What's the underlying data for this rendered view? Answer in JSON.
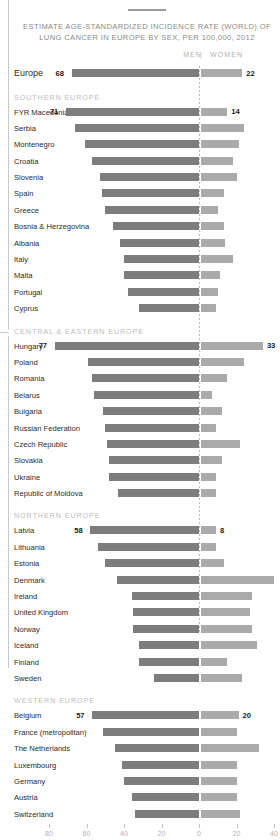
{
  "title": "ESTIMATE AGE-STANDARDIZED INCIDENCE RATE (WORLD) OF LUNG CANCER IN EUROPE BY SEX, PER 100,000, 2012",
  "legend": {
    "men": "MEN",
    "separator": "|",
    "women": "WOMEN"
  },
  "chart_data": {
    "type": "bar",
    "variant": "diverging-horizontal",
    "title": "ESTIMATE AGE-STANDARDIZED INCIDENCE RATE (WORLD) OF LUNG CANCER IN EUROPE BY SEX, PER 100,000, 2012",
    "xlabel": "",
    "ylabel": "",
    "grid": false,
    "legend_position": "top-right",
    "axis": {
      "ticks": [
        80,
        60,
        40,
        20,
        0,
        20,
        40
      ],
      "tick_labels": [
        "80",
        "60",
        "40",
        "20",
        "0",
        "20",
        "40"
      ],
      "left_max": 80,
      "right_max": 40
    },
    "series": [
      {
        "name": "MEN",
        "color": "#7d7d7d",
        "direction": "left"
      },
      {
        "name": "WOMEN",
        "color": "#aaaaaa",
        "direction": "right"
      }
    ],
    "summary_row": {
      "label": "Europe",
      "men": 68,
      "women": 22
    },
    "sections": [
      {
        "label": "SOUTHERN EUROPE",
        "rows": [
          {
            "label": "FYR Macedonia",
            "men": 71,
            "women": 14,
            "show_values": true
          },
          {
            "label": "Serbia",
            "men": 66,
            "women": 23,
            "show_values": false
          },
          {
            "label": "Montenegro",
            "men": 61,
            "women": 20,
            "show_values": false
          },
          {
            "label": "Croatia",
            "men": 57,
            "women": 17,
            "show_values": false
          },
          {
            "label": "Slovenia",
            "men": 53,
            "women": 19,
            "show_values": false
          },
          {
            "label": "Spain",
            "men": 52,
            "women": 12,
            "show_values": false
          },
          {
            "label": "Greece",
            "men": 50,
            "women": 9,
            "show_values": false
          },
          {
            "label": "Bosnia & Herzegovina",
            "men": 46,
            "women": 12,
            "show_values": false
          },
          {
            "label": "Albania",
            "men": 42,
            "women": 13,
            "show_values": false
          },
          {
            "label": "Italy",
            "men": 40,
            "women": 17,
            "show_values": false
          },
          {
            "label": "Malta",
            "men": 40,
            "women": 10,
            "show_values": false
          },
          {
            "label": "Portugal",
            "men": 38,
            "women": 9,
            "show_values": false
          },
          {
            "label": "Cyprus",
            "men": 32,
            "women": 8,
            "show_values": false
          }
        ]
      },
      {
        "label": "CENTRAL & EASTERN EUROPE",
        "rows": [
          {
            "label": "Hungary",
            "men": 77,
            "women": 33,
            "show_values": true
          },
          {
            "label": "Poland",
            "men": 59,
            "women": 23,
            "show_values": false
          },
          {
            "label": "Romania",
            "men": 57,
            "women": 14,
            "show_values": false
          },
          {
            "label": "Belarus",
            "men": 56,
            "women": 6,
            "show_values": false
          },
          {
            "label": "Bulgaria",
            "men": 51,
            "women": 11,
            "show_values": false
          },
          {
            "label": "Russian Federation",
            "men": 50,
            "women": 8,
            "show_values": false
          },
          {
            "label": "Czech Republic",
            "men": 49,
            "women": 21,
            "show_values": false
          },
          {
            "label": "Slovakia",
            "men": 48,
            "women": 11,
            "show_values": false
          },
          {
            "label": "Ukraine",
            "men": 48,
            "women": 8,
            "show_values": false
          },
          {
            "label": "Republic of Moldova",
            "men": 43,
            "women": 8,
            "show_values": false
          }
        ]
      },
      {
        "label": "NORTHERN EUROPE",
        "rows": [
          {
            "label": "Latvia",
            "men": 58,
            "women": 8,
            "show_values": true
          },
          {
            "label": "Lithuania",
            "men": 54,
            "women": 8,
            "show_values": false
          },
          {
            "label": "Estonia",
            "men": 50,
            "women": 12,
            "show_values": false
          },
          {
            "label": "Denmark",
            "men": 44,
            "women": 39,
            "show_values": false
          },
          {
            "label": "Ireland",
            "men": 36,
            "women": 27,
            "show_values": false
          },
          {
            "label": "United Kingdom",
            "men": 35,
            "women": 26,
            "show_values": false
          },
          {
            "label": "Norway",
            "men": 35,
            "women": 27,
            "show_values": false
          },
          {
            "label": "Iceland",
            "men": 32,
            "women": 30,
            "show_values": false
          },
          {
            "label": "Finland",
            "men": 32,
            "women": 14,
            "show_values": false
          },
          {
            "label": "Sweden",
            "men": 24,
            "women": 22,
            "show_values": false
          }
        ]
      },
      {
        "label": "WESTERN EUROPE",
        "rows": [
          {
            "label": "Belgium",
            "men": 57,
            "women": 20,
            "show_values": true
          },
          {
            "label": "France (metropolitan)",
            "men": 51,
            "women": 19,
            "show_values": false
          },
          {
            "label": "The Netherlands",
            "men": 45,
            "women": 31,
            "show_values": false
          },
          {
            "label": "Luxembourg",
            "men": 41,
            "women": 19,
            "show_values": false
          },
          {
            "label": "Germany",
            "men": 40,
            "women": 19,
            "show_values": false
          },
          {
            "label": "Austria",
            "men": 36,
            "women": 19,
            "show_values": false
          },
          {
            "label": "Switzerland",
            "men": 34,
            "women": 21,
            "show_values": false
          }
        ]
      }
    ]
  }
}
